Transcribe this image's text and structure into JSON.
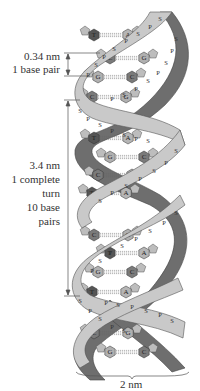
{
  "annotations": {
    "base_pair_rise": {
      "value": "0.34 nm",
      "caption": "1 base pair"
    },
    "turn": {
      "value": "3.4 nm",
      "line2": "1 complete",
      "line3": "turn",
      "line4": "10 base",
      "line5": "pairs"
    },
    "width": {
      "value": "2 nm"
    }
  },
  "strand_labels": {
    "sugar": "S",
    "phosphate": "P"
  },
  "base_pairs": [
    {
      "left": "T",
      "right": "A",
      "y": 35
    },
    {
      "left": "C",
      "right": "G",
      "y": 58
    },
    {
      "left": "G",
      "right": "C",
      "y": 77
    },
    {
      "left": "C",
      "right": "G",
      "y": 97
    },
    {
      "left": "T",
      "right": "A",
      "y": 138
    },
    {
      "left": "G",
      "right": "C",
      "y": 157
    },
    {
      "left": "C",
      "right": "G",
      "y": 175
    },
    {
      "left": "T",
      "right": "A",
      "y": 193
    },
    {
      "left": "C",
      "right": "G",
      "y": 235
    },
    {
      "left": "T",
      "right": "A",
      "y": 253
    },
    {
      "left": "G",
      "right": "C",
      "y": 272
    },
    {
      "left": "T",
      "right": "A",
      "y": 292
    },
    {
      "left": "C",
      "right": "G",
      "y": 333
    },
    {
      "left": "G",
      "right": "C",
      "y": 352
    }
  ],
  "colors": {
    "front_strand": "#c9c9c9",
    "back_strand": "#6e6e6e",
    "base_T": "#555555",
    "base_A": "#b5b5b5",
    "base_C": "#7a7a7a",
    "base_G": "#b0b0b0",
    "text": "#333333"
  }
}
